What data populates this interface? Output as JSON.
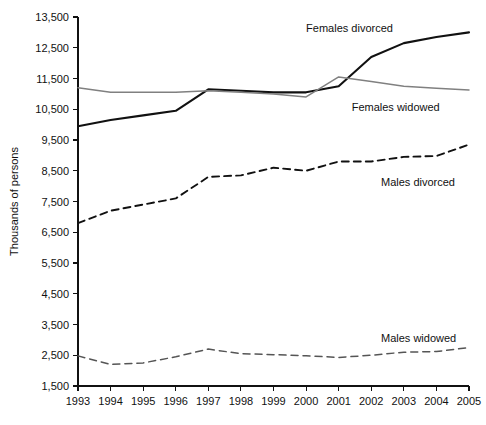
{
  "chart_data": {
    "type": "line",
    "title": "",
    "xlabel": "",
    "ylabel": "Thousands of persons",
    "x": [
      1993,
      1994,
      1995,
      1996,
      1997,
      1998,
      1999,
      2000,
      2001,
      2002,
      2003,
      2004,
      2005
    ],
    "xtick_labels": [
      "1993",
      "1994",
      "1995",
      "1996",
      "1997",
      "1998",
      "1999",
      "2000",
      "2001",
      "2002",
      "2003",
      "2004",
      "2005"
    ],
    "ytick_labels": [
      "1,500",
      "2,500",
      "3,500",
      "4,500",
      "5,500",
      "6,500",
      "7,500",
      "8,500",
      "9,500",
      "10,500",
      "11,500",
      "12,500",
      "13,500"
    ],
    "ytick_values": [
      1500,
      2500,
      3500,
      4500,
      5500,
      6500,
      7500,
      8500,
      9500,
      10500,
      11500,
      12500,
      13500
    ],
    "ylim": [
      1500,
      13500
    ],
    "xlim": [
      1993,
      2005
    ],
    "grid": false,
    "legend_position": "inline-annotations",
    "series": [
      {
        "name": "Females divorced",
        "style": "solid",
        "color": "#111111",
        "width": 2.1,
        "label_x": 2000.0,
        "label_y": 13150,
        "values": [
          9950,
          10150,
          10300,
          10450,
          11150,
          11100,
          11050,
          11050,
          11250,
          12200,
          12650,
          12850,
          13000
        ]
      },
      {
        "name": "Females widowed",
        "style": "solid",
        "color": "#808080",
        "width": 1.5,
        "label_x": 2001.4,
        "label_y": 10580,
        "values": [
          11200,
          11050,
          11050,
          11050,
          11100,
          11050,
          11000,
          10900,
          11550,
          11400,
          11250,
          11180,
          11130
        ]
      },
      {
        "name": "Males divorced",
        "style": "dashed",
        "color": "#111111",
        "width": 1.9,
        "label_x": 2002.3,
        "label_y": 8150,
        "values": [
          6800,
          7200,
          7400,
          7600,
          8300,
          8350,
          8600,
          8500,
          8800,
          8800,
          8950,
          8980,
          9350
        ]
      },
      {
        "name": "Males widowed",
        "style": "dashed",
        "color": "#555555",
        "width": 1.5,
        "label_x": 2002.3,
        "label_y": 3050,
        "values": [
          2480,
          2200,
          2250,
          2450,
          2700,
          2550,
          2520,
          2480,
          2430,
          2500,
          2600,
          2620,
          2750
        ]
      }
    ]
  }
}
